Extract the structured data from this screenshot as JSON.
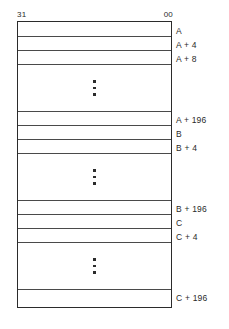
{
  "figure": {
    "bit_header": {
      "msb": "31",
      "lsb": "00"
    },
    "blocks": [
      {
        "base": "A",
        "rows": [
          {
            "label": "A",
            "type": "word"
          },
          {
            "label": "A + 4",
            "type": "word"
          },
          {
            "label": "A + 8",
            "type": "word"
          },
          {
            "label": "",
            "type": "ellipsis"
          },
          {
            "label": "A + 196",
            "type": "word"
          }
        ]
      },
      {
        "base": "B",
        "rows": [
          {
            "label": "B",
            "type": "word"
          },
          {
            "label": "B + 4",
            "type": "word"
          },
          {
            "label": "",
            "type": "ellipsis"
          },
          {
            "label": "B + 196",
            "type": "word"
          }
        ]
      },
      {
        "base": "C",
        "rows": [
          {
            "label": "C",
            "type": "word"
          },
          {
            "label": "C + 4",
            "type": "word"
          },
          {
            "label": "",
            "type": "ellipsis"
          },
          {
            "label": "C + 196",
            "type": "word"
          }
        ]
      }
    ],
    "colors": {
      "border": "#2b2b2b",
      "rule": "#4a4a4a",
      "text": "#2a2a2a",
      "background": "#ffffff"
    }
  }
}
